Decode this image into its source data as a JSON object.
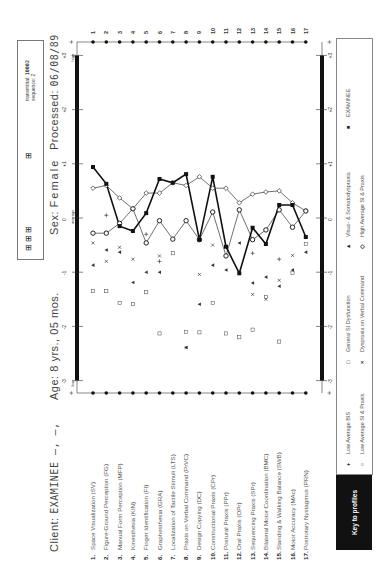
{
  "header": {
    "transmittal_label": "transmittal:",
    "transmittal_value": "10002",
    "sequence_label": "sequence:",
    "sequence_value": "2",
    "glyphs_left": "⊞",
    "glyphs_right": "⊞ ⊞ ⊞",
    "processed_label": "Processed:",
    "processed_value": "06/08/89",
    "sex_label": "Sex:",
    "sex_value": "Female",
    "age_label": "Age:",
    "age_value": "8 yrs., 05 mos.",
    "client_label": "Client:",
    "client_value": "EXAMINEE  –,  –,"
  },
  "axis": {
    "ticks_top": [
      "-3",
      "-2",
      "-1",
      "0",
      "+1",
      "+2",
      "+3"
    ],
    "low_label": "low",
    "average_label": "average",
    "high_label": "high"
  },
  "items": [
    {
      "num": "1.",
      "label": "Space Visualization (SV)"
    },
    {
      "num": "2.",
      "label": "Figure-Ground Perception (FG)"
    },
    {
      "num": "3.",
      "label": "Manual Form Perception (MFP)"
    },
    {
      "num": "4.",
      "label": "Kinesthesia (KIN)"
    },
    {
      "num": "5.",
      "label": "Finger Identification (FI)"
    },
    {
      "num": "6.",
      "label": "Graphesthesia (GRA)"
    },
    {
      "num": "7.",
      "label": "Localization of Tactile Stimuli (LTS)"
    },
    {
      "num": "8.",
      "label": "Praxis on Verbal Command (PrVC)"
    },
    {
      "num": "9.",
      "label": "Design Copying (DC)"
    },
    {
      "num": "10.",
      "label": "Constructional Praxis (CPr)"
    },
    {
      "num": "11.",
      "label": "Postural Praxis (PPr)"
    },
    {
      "num": "12.",
      "label": "Oral Praxis (OPr)"
    },
    {
      "num": "13.",
      "label": "Sequencing Praxis (SPr)"
    },
    {
      "num": "14.",
      "label": "Bilateral Motor Coordination (BMC)"
    },
    {
      "num": "15.",
      "label": "Standing & Walking Balance (SWB)"
    },
    {
      "num": "16.",
      "label": "Motor Accuracy (MAc)"
    },
    {
      "num": "17.",
      "label": "Postrotary Nystagmus (PRN)"
    }
  ],
  "right_numbers": [
    "1",
    "2",
    "3",
    "4",
    "5",
    "6",
    "7",
    "8",
    "9",
    "10",
    "11",
    "12",
    "13",
    "14",
    "15",
    "16",
    "17"
  ],
  "legend": {
    "key_title": "Key to profiles",
    "entries": [
      {
        "symbol": "+",
        "label": "Low Average BIS"
      },
      {
        "symbol": "○",
        "label": "Low Average SI & Praxis"
      },
      {
        "symbol": "□",
        "label": "General SI Dysfunction"
      },
      {
        "symbol": "×",
        "label": "Dyspraxia on Verbal Command"
      },
      {
        "symbol": "▲",
        "label": "Visuo- & Somatodyspraxia"
      },
      {
        "symbol": "◇",
        "label": "High Average SI & Praxis"
      },
      {
        "symbol": "■",
        "label": "EXAMINEE"
      }
    ]
  },
  "chart_data": {
    "type": "line",
    "orientation": "horizontal (scores on x, tests on y)",
    "categories": [
      "SV",
      "FG",
      "MFP",
      "KIN",
      "FI",
      "GRA",
      "LTS",
      "PrVC",
      "DC",
      "CPr",
      "PPr",
      "OPr",
      "SPr",
      "BMC",
      "SWB",
      "MAc",
      "PRN"
    ],
    "xlabel": "Standard score (SD units)",
    "xlim": [
      -3,
      3
    ],
    "x_ticks": [
      -3,
      -2,
      -1,
      0,
      1,
      2,
      3
    ],
    "x_tick_annotations": {
      "-3": "low",
      "0": "average",
      "3": "high"
    },
    "series": [
      {
        "name": "EXAMINEE",
        "marker": "filled-circle",
        "line": "thick",
        "values": [
          0.94,
          0.63,
          -0.15,
          -0.24,
          0.09,
          0.72,
          0.65,
          0.81,
          -0.4,
          0.76,
          -0.53,
          -1.02,
          -0.18,
          -0.48,
          0.24,
          0.24,
          -0.35
        ]
      },
      {
        "name": "High Average SI & Praxis",
        "marker": "diamond",
        "line": "thin",
        "values": [
          0.55,
          0.6,
          0.37,
          0.17,
          0.46,
          0.46,
          0.65,
          0.6,
          0.76,
          0.55,
          0.55,
          0.28,
          0.44,
          0.48,
          0.5,
          0.28,
          0.13
        ]
      },
      {
        "name": "Low Average SI & Praxis",
        "marker": "circle",
        "line": "thin",
        "values": [
          -0.28,
          -0.28,
          -0.1,
          0.17,
          -0.46,
          -0.05,
          -0.39,
          -0.05,
          -0.4,
          0.11,
          -0.7,
          0.15,
          -0.4,
          -0.22,
          0.15,
          -0.17,
          0.13
        ]
      },
      {
        "name": "Low Average BIS",
        "marker": "plus",
        "line": "none",
        "values": [
          null,
          0.05,
          null,
          null,
          -0.3,
          -0.8,
          null,
          null,
          null,
          null,
          null,
          null,
          -0.65,
          null,
          -0.76,
          null,
          null
        ]
      },
      {
        "name": "General SI Dysfunction",
        "marker": "square",
        "line": "none",
        "values": [
          -1.35,
          -1.35,
          -1.57,
          -1.59,
          -1.37,
          -2.13,
          -0.65,
          -2.1,
          -2.11,
          -1.57,
          -2.13,
          -2.2,
          -2.06,
          -1.46,
          -2.28,
          -1.01,
          -0.48
        ]
      },
      {
        "name": "Dyspraxia on Verbal Command",
        "marker": "x",
        "line": "none",
        "values": [
          -0.46,
          -0.8,
          -0.54,
          -0.76,
          null,
          -0.7,
          null,
          -2.39,
          -1.04,
          -0.5,
          -0.7,
          null,
          -1.41,
          -1.5,
          -1.15,
          -0.69,
          null
        ]
      },
      {
        "name": "Visuo- & Somatodyspraxia",
        "marker": "triangle",
        "line": "none",
        "values": [
          -0.87,
          -0.59,
          -0.63,
          -1.19,
          -1.0,
          -1.0,
          null,
          -2.39,
          -1.59,
          -0.87,
          -0.96,
          -0.46,
          -1.2,
          -1.09,
          -1.26,
          -0.96,
          -0.63
        ]
      }
    ],
    "grid": false,
    "legend_position": "bottom"
  }
}
